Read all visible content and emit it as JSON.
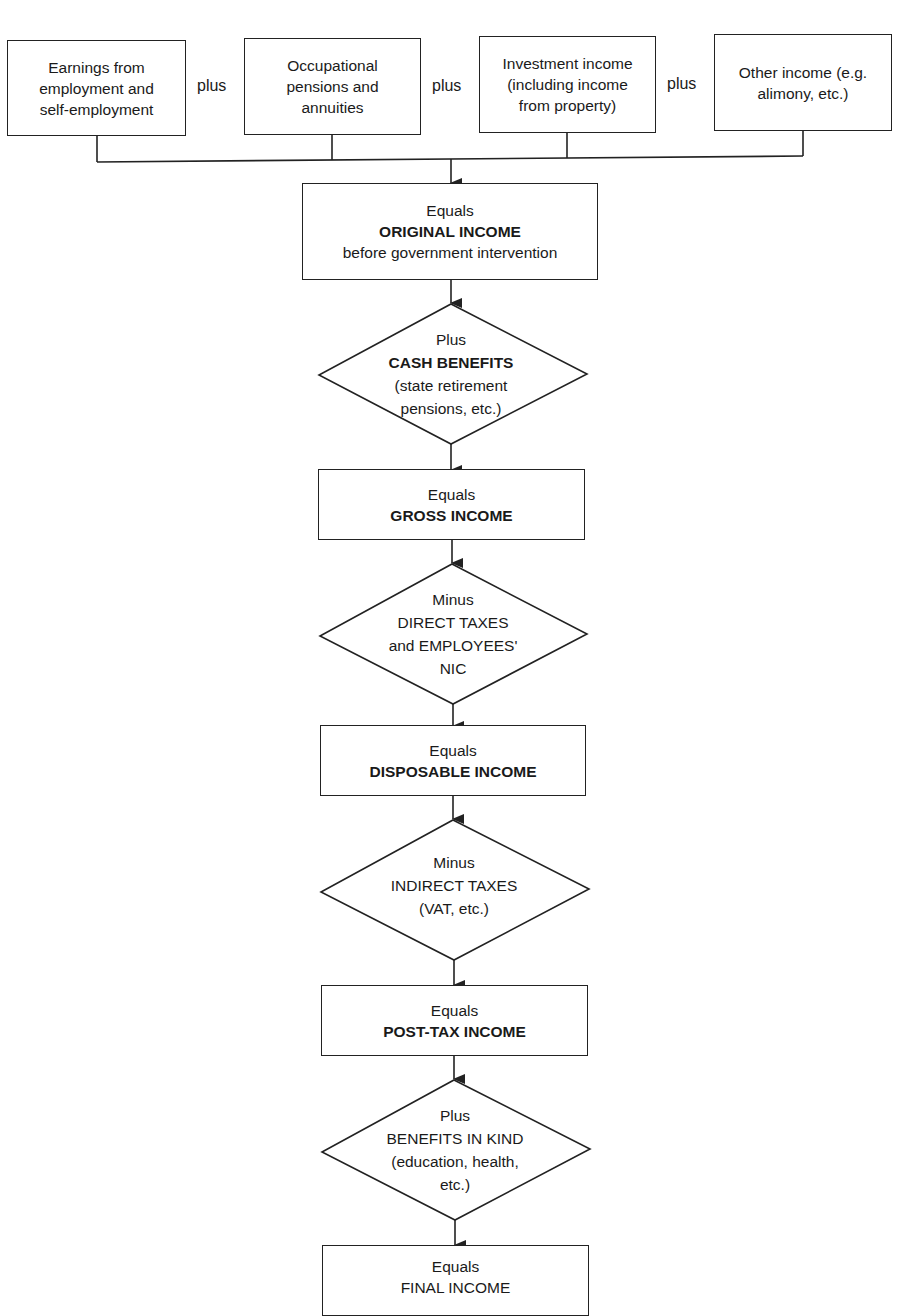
{
  "sources": [
    {
      "lines": [
        "Earnings from",
        "employment and",
        "self-employment"
      ]
    },
    {
      "lines": [
        "Occupational",
        "pensions and",
        "annuities"
      ]
    },
    {
      "lines": [
        "Investment income",
        "(including income",
        "from property)"
      ]
    },
    {
      "lines": [
        "Other income (e.g.",
        "alimony, etc.)"
      ]
    }
  ],
  "connector_label": "plus",
  "steps": [
    {
      "type": "box",
      "lines": [
        "Equals",
        "ORIGINAL INCOME",
        "before government intervention"
      ],
      "bold": [
        1
      ]
    },
    {
      "type": "diamond",
      "lines": [
        "Plus",
        "CASH BENEFITS",
        "(state retirement",
        "pensions, etc.)"
      ],
      "bold": [
        1
      ]
    },
    {
      "type": "box",
      "lines": [
        "Equals",
        "GROSS INCOME"
      ],
      "bold": [
        1
      ]
    },
    {
      "type": "diamond",
      "lines": [
        "Minus",
        "DIRECT TAXES",
        "and EMPLOYEES'",
        "NIC"
      ],
      "bold": []
    },
    {
      "type": "box",
      "lines": [
        "Equals",
        "DISPOSABLE INCOME"
      ],
      "bold": [
        1
      ]
    },
    {
      "type": "diamond",
      "lines": [
        "Minus",
        "INDIRECT TAXES",
        "(VAT, etc.)"
      ],
      "bold": []
    },
    {
      "type": "box",
      "lines": [
        "Equals",
        "POST-TAX INCOME"
      ],
      "bold": [
        1
      ]
    },
    {
      "type": "diamond",
      "lines": [
        "Plus",
        "BENEFITS IN KIND",
        "(education, health,",
        "etc.)"
      ],
      "bold": []
    },
    {
      "type": "box",
      "lines": [
        "Equals",
        "FINAL INCOME"
      ],
      "bold": []
    }
  ]
}
